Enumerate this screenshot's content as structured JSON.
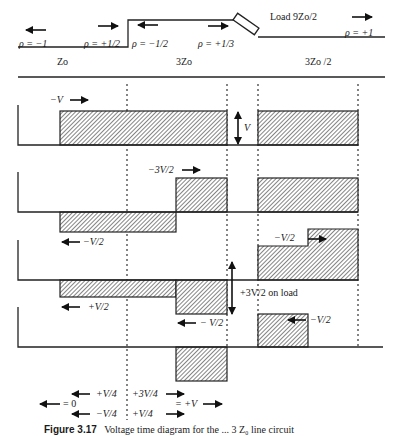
{
  "line_diagram": {
    "reflections": {
      "rho_source": "ρ = −1",
      "rho_junction_left": "ρ = +1/2",
      "rho_junction_right": "ρ = −1/2",
      "rho_load_left": "ρ = +1/3",
      "rho_end": "ρ = +1"
    },
    "impedances": {
      "section1": "Zo",
      "section2": "3Zo",
      "section3": "3Zo /2"
    },
    "load_label": "Load 9Zo/2"
  },
  "panels": {
    "p1": {
      "incident_label": "−V",
      "step_label": "V"
    },
    "p2": {
      "wave_right_label": "−3V/2",
      "wave_left_label": "−V/2"
    },
    "p3": {
      "left_label": "+V/2",
      "right_label": "−V/2",
      "mid_label": "− V/2",
      "load_label": "+3V/2 on load"
    },
    "p4": {
      "right_label": "−V/2"
    }
  },
  "summary": {
    "top_left": "+V/4",
    "top_right": "+3V/4",
    "far_left": "= 0",
    "far_right": "= +V",
    "bottom_left": "−V/4",
    "bottom_right": "+V/4"
  },
  "caption": {
    "number": "Figure 3.17",
    "text": "Voltage time diagram for the ... 3 Z₀ line circuit"
  },
  "colors": {
    "ink": "#1a1a1a",
    "hatch": "#333333",
    "background": "#ffffff"
  }
}
